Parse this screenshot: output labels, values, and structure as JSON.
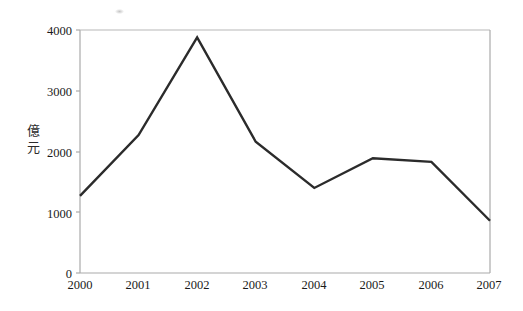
{
  "chart_data": {
    "type": "line",
    "title": "",
    "subtitle": "",
    "xlabel": "",
    "ylabel": "億元",
    "ylabel_chars": [
      "億",
      "元"
    ],
    "categories": [
      "2000",
      "2001",
      "2002",
      "2003",
      "2004",
      "2005",
      "2006",
      "2007"
    ],
    "x": [
      2000,
      2001,
      2002,
      2003,
      2004,
      2005,
      2006,
      2007
    ],
    "values": [
      1270,
      2270,
      3880,
      2160,
      1400,
      1890,
      1830,
      860
    ],
    "series": [
      {
        "name": "",
        "values": [
          1270,
          2270,
          3880,
          2160,
          1400,
          1890,
          1830,
          860
        ]
      }
    ],
    "ylim": [
      0,
      4000
    ],
    "xlim": [
      2000,
      2007
    ],
    "y_ticks": [
      0,
      1000,
      2000,
      3000,
      4000
    ],
    "y_tick_labels": [
      "0",
      "1000",
      "2000",
      "3000",
      "4000"
    ],
    "x_ticks": [
      2000,
      2001,
      2002,
      2003,
      2004,
      2005,
      2006,
      2007
    ],
    "x_tick_labels": [
      "2000",
      "2001",
      "2002",
      "2003",
      "2004",
      "2005",
      "2006",
      "2007"
    ],
    "grid": false,
    "legend": false,
    "legend_position": "none",
    "markers": false,
    "annotations": []
  },
  "style": {
    "line_color": "#2b2b2b",
    "axis_color": "#a8a8a8",
    "text_color": "#1a1a1a",
    "background_color": "#ffffff",
    "line_width": 2.4
  },
  "axis": {
    "y_title": "億元",
    "y_title_char_1": "億",
    "y_title_char_2": "元",
    "y_labels": {
      "t0": "0",
      "t1": "1000",
      "t2": "2000",
      "t3": "3000",
      "t4": "4000"
    },
    "x_labels": {
      "y2000": "2000",
      "y2001": "2001",
      "y2002": "2002",
      "y2003": "2003",
      "y2004": "2004",
      "y2005": "2005",
      "y2006": "2006",
      "y2007": "2007"
    }
  }
}
